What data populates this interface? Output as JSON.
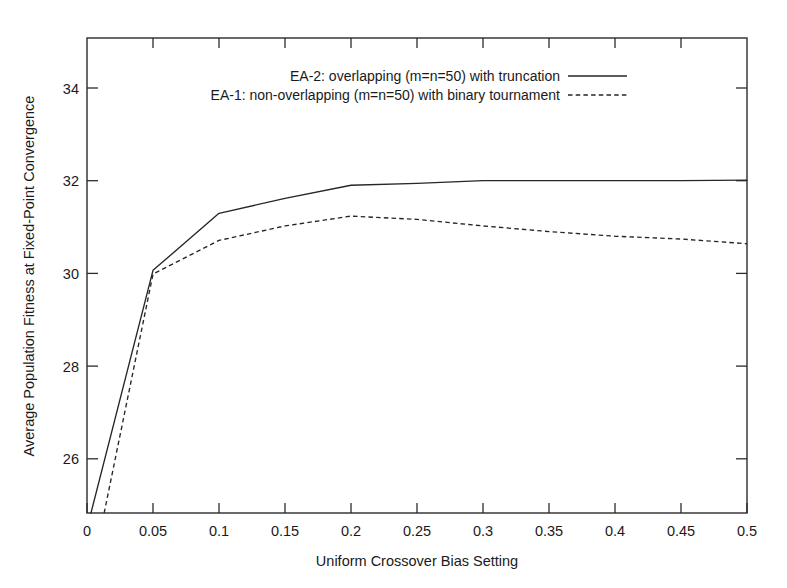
{
  "chart_data": {
    "type": "line",
    "title": "",
    "xlabel": "Uniform Crossover Bias Setting",
    "ylabel": "Average Population Fitness at Fixed-Point Convergence",
    "xlim": [
      0,
      0.5
    ],
    "ylim": [
      24.84,
      35.0
    ],
    "xticks": [
      0,
      0.05,
      0.1,
      0.15,
      0.2,
      0.25,
      0.3,
      0.35,
      0.4,
      0.45,
      0.5
    ],
    "xtick_labels": [
      "0",
      "0.05",
      "0.1",
      "0.15",
      "0.2",
      "0.25",
      "0.3",
      "0.35",
      "0.4",
      "0.45",
      "0.5"
    ],
    "yticks": [
      26,
      28,
      30,
      32,
      34
    ],
    "ytick_labels": [
      "26",
      "28",
      "30",
      "32",
      "34"
    ],
    "grid": false,
    "legend_position": "top-center",
    "series": [
      {
        "name": "EA-2: overlapping (m=n=50) with truncation",
        "style": "solid",
        "color": "#262626",
        "x": [
          0.003,
          0.05,
          0.1,
          0.15,
          0.2,
          0.25,
          0.3,
          0.35,
          0.4,
          0.45,
          0.5
        ],
        "values": [
          24.84,
          30.03,
          31.25,
          31.57,
          31.85,
          31.89,
          31.95,
          31.95,
          31.95,
          31.95,
          31.96
        ]
      },
      {
        "name": "EA-1: non-overlapping (m=n=50) with binary tournament",
        "style": "dashed",
        "color": "#262626",
        "x": [
          0.013,
          0.05,
          0.1,
          0.15,
          0.2,
          0.25,
          0.3,
          0.35,
          0.4,
          0.45,
          0.5
        ],
        "values": [
          24.84,
          29.95,
          30.67,
          30.98,
          31.19,
          31.12,
          30.98,
          30.86,
          30.76,
          30.7,
          30.6
        ]
      }
    ]
  },
  "legend": {
    "entries": [
      {
        "label": "EA-2: overlapping (m=n=50) with truncation",
        "style": "solid"
      },
      {
        "label": "EA-1: non-overlapping (m=n=50) with binary tournament",
        "style": "dashed"
      }
    ]
  },
  "axes": {
    "x_title": "Uniform Crossover Bias Setting",
    "y_title": "Average Population Fitness at Fixed-Point Convergence"
  }
}
